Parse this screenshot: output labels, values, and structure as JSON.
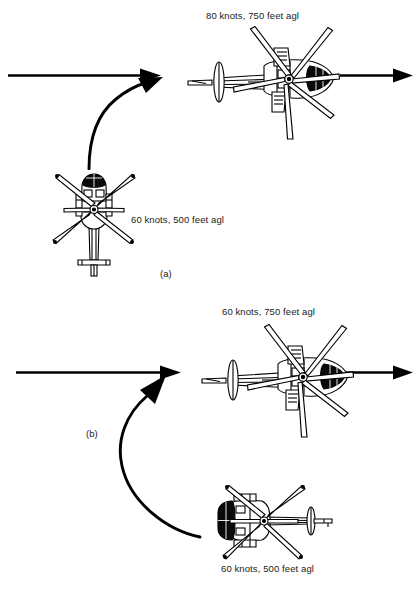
{
  "figure": {
    "background_color": "#ffffff",
    "ink_color": "#000000",
    "type": "technical-diagram"
  },
  "panels": [
    {
      "tag": "(a)",
      "tag_name": "panel-a-label",
      "entry_aircraft": {
        "name": "helicopter-top-view-nose-up",
        "heading": "north",
        "annotation": "60 knots, 500 feet agl"
      },
      "exit_aircraft": {
        "name": "helicopter-top-view-nose-right",
        "heading": "east",
        "annotation": "80 knots, 750 feet agl"
      },
      "turn": "90-degree right turn, climbing and accelerating"
    },
    {
      "tag": "(b)",
      "tag_name": "panel-b-label",
      "entry_aircraft": {
        "name": "helicopter-top-view-nose-left",
        "heading": "west",
        "annotation": "60 knots, 500 feet agl"
      },
      "exit_aircraft": {
        "name": "helicopter-top-view-nose-right",
        "heading": "east",
        "annotation": "60 knots, 750 feet agl"
      },
      "turn": "180-degree reversal turn, climbing at constant speed"
    }
  ],
  "annotations": {
    "a_top": "80 knots, 750 feet agl",
    "a_bottom": "60 knots, 500 feet agl",
    "a_tag": "(a)",
    "b_top": "60 knots, 750 feet agl",
    "b_bottom": "60 knots, 500 feet agl",
    "b_tag": "(b)"
  },
  "arrows": {
    "a_inbound_track": "straight-flight-path-arrow-left",
    "a_turn": "curved-climbing-turn-arrow",
    "a_outbound_track": "straight-flight-path-arrow-right",
    "b_inbound_track": "straight-flight-path-arrow-left",
    "b_turn": "curved-reversal-turn-arrow",
    "b_outbound_track": "straight-flight-path-arrow-right"
  }
}
